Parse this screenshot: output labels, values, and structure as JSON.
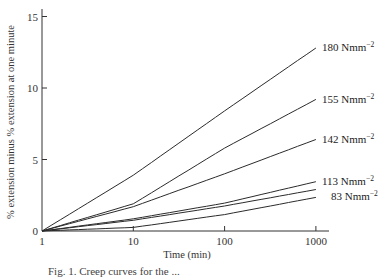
{
  "chart_data": {
    "type": "line",
    "title": "",
    "xlabel": "Time (min)",
    "ylabel": "% extension minus % extension at one minute",
    "x_scale": "log",
    "xlim": [
      1,
      1500
    ],
    "ylim": [
      0,
      15.5
    ],
    "x_ticks": [
      1,
      10,
      100,
      1000
    ],
    "x_tick_labels": [
      "1",
      "10",
      "100",
      "1000"
    ],
    "y_ticks": [
      0,
      5,
      10,
      15
    ],
    "y_tick_labels": [
      "0",
      "5",
      "10",
      "15"
    ],
    "grid": false,
    "legend_position": "inline-right",
    "x": [
      1,
      10,
      100,
      1000
    ],
    "series": [
      {
        "name": "180 Nmm⁻²",
        "label": "180 Nmm",
        "sup": "−2",
        "values": [
          0,
          3.9,
          8.4,
          12.8
        ]
      },
      {
        "name": "155 Nmm⁻²",
        "label": "155 Nmm",
        "sup": "−2",
        "values": [
          0,
          1.9,
          5.8,
          9.2
        ]
      },
      {
        "name": "142 Nmm⁻²",
        "label": "142 Nmm",
        "sup": "−2",
        "values": [
          0,
          1.7,
          4.0,
          6.4
        ]
      },
      {
        "name": "113 Nmm⁻²",
        "label": "113 Nmm",
        "sup": "−2",
        "values": [
          0,
          0.85,
          1.95,
          3.45
        ]
      },
      {
        "name": "(unlabeled)",
        "label": "",
        "sup": "",
        "values": [
          0,
          0.75,
          1.75,
          2.9
        ]
      },
      {
        "name": "83 Nmm⁻²",
        "label": "83 Nmm",
        "sup": "−2",
        "values": [
          0,
          0.25,
          1.15,
          2.35
        ]
      }
    ],
    "annotations": [
      "Fig. 1. Creep curves for ... (caption clipped at bottom edge)"
    ]
  },
  "caption": "Fig. 1.  Creep curves for the ..."
}
